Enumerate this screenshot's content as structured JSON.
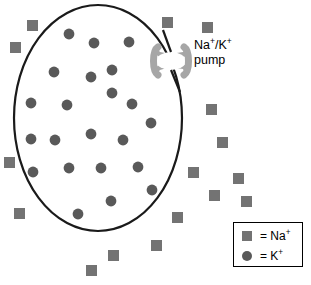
{
  "diagram": {
    "colors": {
      "membrane_stroke": "#1a1a1a",
      "cell_fill": "#ffffff",
      "sodium_square": "#737373",
      "potassium_circle": "#595959",
      "pump_fill": "#a6a6a6",
      "background": "#ffffff",
      "legend_border": "#000000",
      "text": "#000000"
    },
    "membrane": {
      "name": "cell-membrane-outline",
      "cx": 98,
      "cy": 118,
      "rx": 84,
      "ry": 113,
      "stroke_width": 2.2
    }
  },
  "pump": {
    "label_line1_base": "Na",
    "label_line1_sup1": "+",
    "label_line1_mid": "/K",
    "label_line1_sup2": "+",
    "label_line2": "pump",
    "label_full": "Na+/K+ pump",
    "position": {
      "x": 171,
      "y": 60
    }
  },
  "legend": {
    "name": "legend-box",
    "rows": [
      {
        "symbol": "square",
        "symbol_name": "sodium-ion-square-swatch",
        "text_base": "= Na",
        "text_sup": "+",
        "text_full": "= Na+"
      },
      {
        "symbol": "circle",
        "symbol_name": "potassium-ion-circle-swatch",
        "text_base": "= K",
        "text_sup": "+",
        "text_full": "= K+"
      }
    ]
  },
  "ions": {
    "sodium_label": "Na+",
    "potassium_label": "K+",
    "sodium_count": 16,
    "potassium_count": 22,
    "sodium_size": 11,
    "potassium_radius": 5.4,
    "sodium_squares": [
      {
        "x": 27,
        "y": 20
      },
      {
        "x": 10,
        "y": 42
      },
      {
        "x": 162,
        "y": 17
      },
      {
        "x": 202,
        "y": 22
      },
      {
        "x": 206,
        "y": 104
      },
      {
        "x": 217,
        "y": 137
      },
      {
        "x": 188,
        "y": 167
      },
      {
        "x": 209,
        "y": 190
      },
      {
        "x": 172,
        "y": 212
      },
      {
        "x": 151,
        "y": 240
      },
      {
        "x": 108,
        "y": 250
      },
      {
        "x": 86,
        "y": 265
      },
      {
        "x": 14,
        "y": 208
      },
      {
        "x": 4,
        "y": 157
      },
      {
        "x": 233,
        "y": 173
      },
      {
        "x": 241,
        "y": 196
      }
    ],
    "potassium_circles": [
      {
        "x": 69,
        "y": 34
      },
      {
        "x": 94,
        "y": 43
      },
      {
        "x": 129,
        "y": 42
      },
      {
        "x": 54,
        "y": 72
      },
      {
        "x": 91,
        "y": 77
      },
      {
        "x": 112,
        "y": 70
      },
      {
        "x": 31,
        "y": 103
      },
      {
        "x": 67,
        "y": 105
      },
      {
        "x": 112,
        "y": 93
      },
      {
        "x": 132,
        "y": 104
      },
      {
        "x": 151,
        "y": 123
      },
      {
        "x": 31,
        "y": 139
      },
      {
        "x": 55,
        "y": 140
      },
      {
        "x": 91,
        "y": 134
      },
      {
        "x": 123,
        "y": 140
      },
      {
        "x": 33,
        "y": 172
      },
      {
        "x": 69,
        "y": 168
      },
      {
        "x": 101,
        "y": 168
      },
      {
        "x": 138,
        "y": 167
      },
      {
        "x": 111,
        "y": 201
      },
      {
        "x": 78,
        "y": 214
      },
      {
        "x": 152,
        "y": 190
      }
    ]
  }
}
